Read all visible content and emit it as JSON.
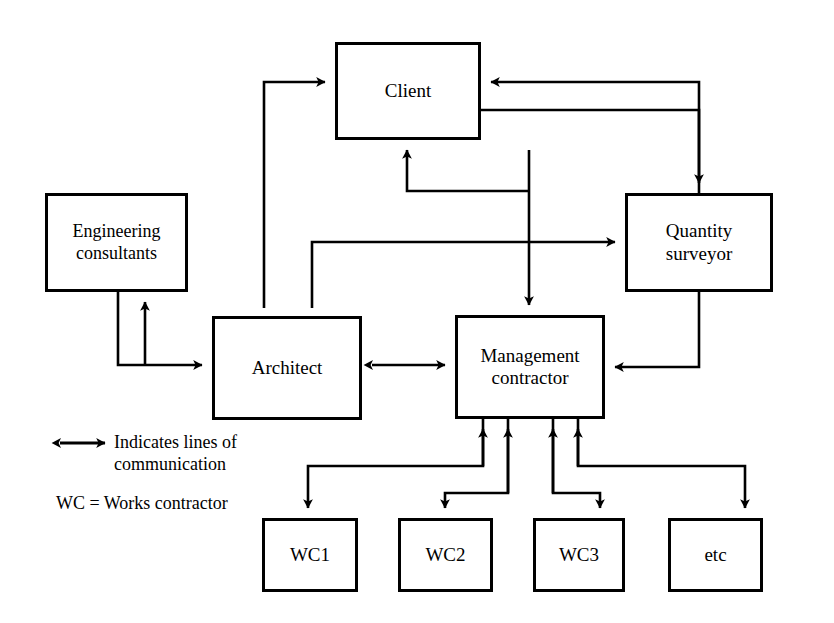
{
  "diagram": {
    "type": "organisation-flow-diagram",
    "background_color": "#ffffff",
    "line_color": "#000000",
    "nodes": [
      {
        "id": "client",
        "label": "Client",
        "x": 335,
        "y": 42,
        "w": 146,
        "h": 98,
        "font_size": 19
      },
      {
        "id": "engineering",
        "label": "Engineering\nconsultants",
        "x": 45,
        "y": 193,
        "w": 143,
        "h": 99,
        "font_size": 18
      },
      {
        "id": "quantity",
        "label": "Quantity\nsurveyor",
        "x": 625,
        "y": 193,
        "w": 148,
        "h": 99,
        "font_size": 19
      },
      {
        "id": "architect",
        "label": "Architect",
        "x": 212,
        "y": 316,
        "w": 150,
        "h": 104,
        "font_size": 19
      },
      {
        "id": "management",
        "label": "Management\ncontractor",
        "x": 455,
        "y": 315,
        "w": 150,
        "h": 104,
        "font_size": 19
      },
      {
        "id": "wc1",
        "label": "WC1",
        "x": 262,
        "y": 518,
        "w": 96,
        "h": 74,
        "font_size": 19
      },
      {
        "id": "wc2",
        "label": "WC2",
        "x": 398,
        "y": 518,
        "w": 95,
        "h": 74,
        "font_size": 19
      },
      {
        "id": "wc3",
        "label": "WC3",
        "x": 533,
        "y": 518,
        "w": 92,
        "h": 74,
        "font_size": 19
      },
      {
        "id": "etc",
        "label": "etc",
        "x": 668,
        "y": 518,
        "w": 95,
        "h": 74,
        "font_size": 19
      }
    ],
    "legend": {
      "arrow_label": "Indicates lines of\n   communication",
      "abbreviation_note": "WC = Works contractor"
    },
    "connections": [
      {
        "id": "architect-to-client",
        "from": "architect",
        "to": "client",
        "arrowheads": "both-ends-separate"
      },
      {
        "id": "quantity-to-client",
        "from": "quantity",
        "to": "client",
        "arrowheads": "single"
      },
      {
        "id": "client-to-quantity",
        "from": "client",
        "to": "quantity",
        "arrowheads": "single"
      },
      {
        "id": "client-to-management",
        "from": "client",
        "to": "management",
        "arrowheads": "single"
      },
      {
        "id": "management-to-client",
        "from": "management",
        "to": "client",
        "arrowheads": "single"
      },
      {
        "id": "architect-to-quantity",
        "from": "architect",
        "to": "quantity",
        "arrowheads": "single"
      },
      {
        "id": "quantity-to-management",
        "from": "quantity",
        "to": "management",
        "arrowheads": "single"
      },
      {
        "id": "engineering-to-architect",
        "from": "engineering",
        "to": "architect",
        "arrowheads": "single"
      },
      {
        "id": "architect-to-engineering",
        "from": "architect",
        "to": "engineering",
        "arrowheads": "single"
      },
      {
        "id": "architect-management",
        "from": "architect",
        "to": "management",
        "arrowheads": "double"
      },
      {
        "id": "management-to-wc1",
        "from": "management",
        "to": "wc1",
        "arrowheads": "single"
      },
      {
        "id": "management-to-wc2",
        "from": "management",
        "to": "wc2",
        "arrowheads": "single"
      },
      {
        "id": "management-to-wc3",
        "from": "management",
        "to": "wc3",
        "arrowheads": "single"
      },
      {
        "id": "management-to-etc",
        "from": "management",
        "to": "etc",
        "arrowheads": "single"
      },
      {
        "id": "wc1-to-management",
        "from": "wc1",
        "to": "management",
        "arrowheads": "single"
      },
      {
        "id": "wc2-to-management",
        "from": "wc2",
        "to": "management",
        "arrowheads": "single"
      },
      {
        "id": "wc3-to-management",
        "from": "wc3",
        "to": "management",
        "arrowheads": "single"
      },
      {
        "id": "etc-to-management",
        "from": "etc",
        "to": "management",
        "arrowheads": "single"
      }
    ]
  }
}
